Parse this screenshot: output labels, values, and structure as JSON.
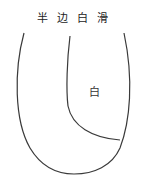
{
  "diagram": {
    "title_chars": [
      "半",
      "边",
      "白",
      "滑"
    ],
    "region_label": "白",
    "stroke_color": "#3a3a3a",
    "background": "#ffffff"
  }
}
